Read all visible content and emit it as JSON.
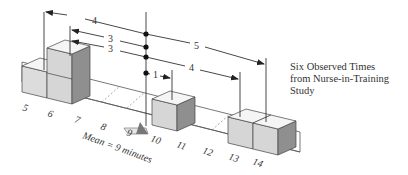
{
  "caption": {
    "line1": "Six Observed Times",
    "line2": "from Nurse-in-Training",
    "line3": "Study"
  },
  "axis": {
    "ticks": [
      "5",
      "6",
      "7",
      "8",
      "9",
      "10",
      "11",
      "12",
      "13",
      "14"
    ],
    "mean_label": "Mean = 9 minutes"
  },
  "deviations": [
    {
      "label": "4",
      "from": 9,
      "to": 5
    },
    {
      "label": "3",
      "from": 9,
      "to": 6
    },
    {
      "label": "3",
      "from": 9,
      "to": 6
    },
    {
      "label": "1",
      "from": 9,
      "to": 10
    },
    {
      "label": "4",
      "from": 9,
      "to": 13
    },
    {
      "label": "5",
      "from": 9,
      "to": 14
    }
  ],
  "observations": [
    5,
    6,
    6,
    10,
    13,
    14
  ],
  "mean": 9,
  "colors": {
    "block_front": "#d9d9d9",
    "block_top": "#f4f4f4",
    "block_side": "#8c8c8c",
    "line": "#333333"
  }
}
